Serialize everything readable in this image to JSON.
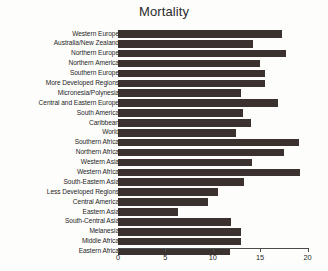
{
  "chart_data": {
    "type": "bar",
    "orientation": "horizontal",
    "title": "Mortality",
    "xlabel": "",
    "ylabel": "",
    "xlim": [
      0,
      20
    ],
    "xticks": [
      0,
      5,
      10,
      15,
      20
    ],
    "grid": false,
    "legend": null,
    "bar_color": "#3b322f",
    "categories": [
      "Western Europe",
      "Australia/New Zealand",
      "Northern Europe",
      "Northern America",
      "Southern Europe",
      "More Developed Regions",
      "Micronesia/Polynesia",
      "Central and Eastern Europe",
      "South America",
      "Caribbean",
      "World",
      "Southern Africa",
      "Northern Africa",
      "Western Asia",
      "Western Africa",
      "South-Eastern Asia",
      "Less Developed Regions",
      "Central America",
      "Eastern Asia",
      "South-Central Asia",
      "Melanesia",
      "Middle Africa",
      "Eastern Africa"
    ],
    "values": [
      17.3,
      14.2,
      17.7,
      15.0,
      15.5,
      15.5,
      13.0,
      16.9,
      13.2,
      14.0,
      12.5,
      19.1,
      17.5,
      14.1,
      19.2,
      13.3,
      10.6,
      9.5,
      6.3,
      11.9,
      13.0,
      13.0,
      11.8
    ]
  }
}
